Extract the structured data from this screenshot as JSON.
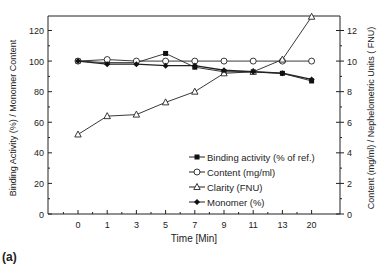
{
  "panel_label": "(a)",
  "chart_data": {
    "type": "line",
    "title": "",
    "xlabel": "Time [Min]",
    "ylabel": "Binding Activity (%) / Monomer Content",
    "y2label": "Content (mg/ml) / Nephelometric Units ( FNU)",
    "categories": [
      "0",
      "1",
      "3",
      "5",
      "7",
      "9",
      "11",
      "13",
      "20"
    ],
    "ylim": [
      0,
      130
    ],
    "y2lim": [
      0,
      13
    ],
    "yticks": [
      0,
      20,
      40,
      60,
      80,
      100,
      120
    ],
    "y2ticks": [
      0,
      2,
      4,
      6,
      8,
      10,
      12
    ],
    "grid": false,
    "legend_position": "lower right inside",
    "series": [
      {
        "name": "Binding activity (% of ref.)",
        "marker": "filled-square",
        "axis": "left",
        "values": [
          100,
          99,
          99,
          105,
          96,
          93,
          93,
          92,
          87
        ]
      },
      {
        "name": "Content (mg/ml)",
        "marker": "open-circle",
        "axis": "right",
        "values": [
          10.0,
          10.1,
          10.0,
          10.0,
          10.0,
          10.0,
          10.0,
          10.0,
          10.0
        ]
      },
      {
        "name": "Clarity (FNU)",
        "marker": "open-triangle",
        "axis": "right",
        "values": [
          5.2,
          6.4,
          6.5,
          7.3,
          8.0,
          9.2,
          9.3,
          10.1,
          12.9
        ]
      },
      {
        "name": "Monomer (%)",
        "marker": "filled-diamond",
        "axis": "left",
        "values": [
          100,
          98,
          98,
          97,
          97,
          94,
          93,
          92,
          88
        ]
      }
    ]
  }
}
